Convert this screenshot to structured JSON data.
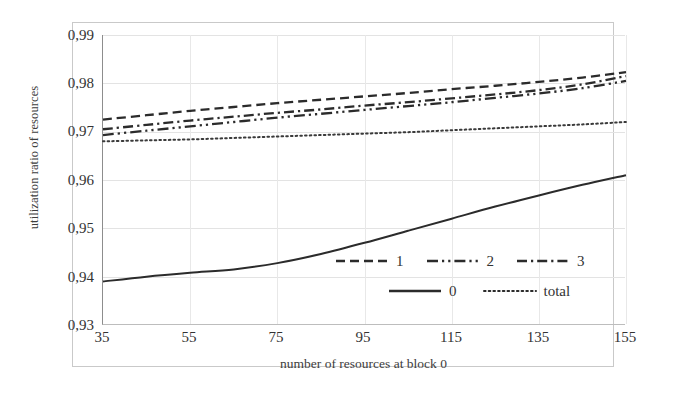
{
  "chart_data": {
    "type": "line",
    "title": "",
    "xlabel": "number of resources at block 0",
    "ylabel": "utilization ratio of resources",
    "xlim": [
      35,
      155
    ],
    "ylim": [
      0.93,
      0.99
    ],
    "xticks": [
      "35",
      "55",
      "75",
      "95",
      "115",
      "135",
      "155"
    ],
    "yticks": [
      "0,99",
      "0,98",
      "0,97",
      "0,96",
      "0,95",
      "0,94",
      "0,93"
    ],
    "grid": true,
    "legend_position": "inside-lower-right",
    "decimal_separator": ",",
    "x": [
      35,
      45,
      55,
      65,
      75,
      85,
      95,
      105,
      115,
      125,
      135,
      145,
      155
    ],
    "series": [
      {
        "name": "1",
        "style": "dashed",
        "color": "#2b2b2b",
        "values": [
          0.9725,
          0.9734,
          0.9743,
          0.9751,
          0.9759,
          0.9766,
          0.9773,
          0.978,
          0.9788,
          0.9795,
          0.9803,
          0.9812,
          0.9823
        ]
      },
      {
        "name": "2",
        "style": "dash-dot-dot",
        "color": "#2b2b2b",
        "values": [
          0.9693,
          0.9702,
          0.9711,
          0.972,
          0.9729,
          0.9737,
          0.9745,
          0.9753,
          0.9761,
          0.977,
          0.9779,
          0.979,
          0.9805
        ]
      },
      {
        "name": "3",
        "style": "dash-dot",
        "color": "#2b2b2b",
        "values": [
          0.9705,
          0.9714,
          0.9723,
          0.9731,
          0.9739,
          0.9746,
          0.9754,
          0.9761,
          0.9769,
          0.9777,
          0.9786,
          0.9798,
          0.9815
        ]
      },
      {
        "name": "0",
        "style": "solid",
        "color": "#2b2b2b",
        "values": [
          0.939,
          0.94,
          0.9408,
          0.9415,
          0.9428,
          0.9447,
          0.947,
          0.9495,
          0.952,
          0.9545,
          0.9568,
          0.959,
          0.961
        ]
      },
      {
        "name": "total",
        "style": "dotted",
        "color": "#3a3a3a",
        "values": [
          0.968,
          0.9682,
          0.9684,
          0.9687,
          0.969,
          0.9693,
          0.9696,
          0.9699,
          0.9703,
          0.9707,
          0.9711,
          0.9715,
          0.972
        ]
      }
    ]
  },
  "legend": {
    "row1": [
      {
        "label": "1",
        "style": "dashed"
      },
      {
        "label": "2",
        "style": "dash-dot-dot"
      },
      {
        "label": "3",
        "style": "dash-dot"
      }
    ],
    "row2": [
      {
        "label": "0",
        "style": "solid"
      },
      {
        "label": "total",
        "style": "dotted"
      }
    ]
  }
}
